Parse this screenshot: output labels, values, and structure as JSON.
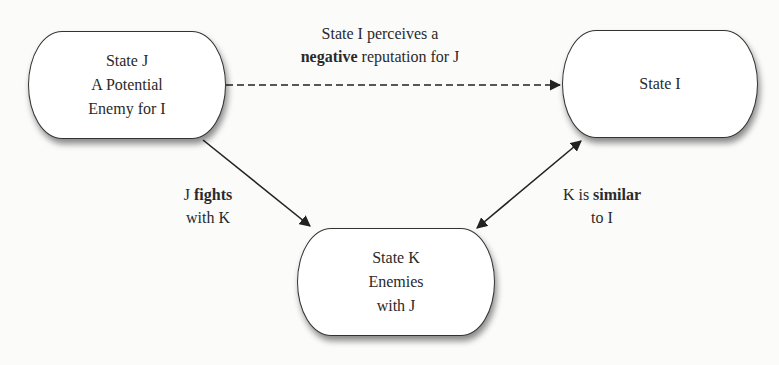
{
  "nodes": {
    "j": {
      "lines": [
        "State J",
        "A Potential",
        "Enemy for I"
      ]
    },
    "i": {
      "lines": [
        "State I"
      ]
    },
    "k": {
      "lines": [
        "State K",
        "Enemies",
        "with J"
      ]
    }
  },
  "edges": {
    "j_to_i": {
      "style": "dashed",
      "line1": "State I perceives a",
      "line2_bold": "negative",
      "line2_rest": " reputation for J"
    },
    "j_to_k": {
      "style": "solid",
      "line1_pre": "J ",
      "line1_bold": "fights",
      "line2": "with K"
    },
    "k_i": {
      "style": "solid-bidirectional",
      "line1_pre": "K is ",
      "line1_bold": "similar",
      "line2": "to I"
    }
  },
  "colors": {
    "stroke": "#333333",
    "background": "#fbfbfa",
    "node_fill": "#ffffff"
  }
}
